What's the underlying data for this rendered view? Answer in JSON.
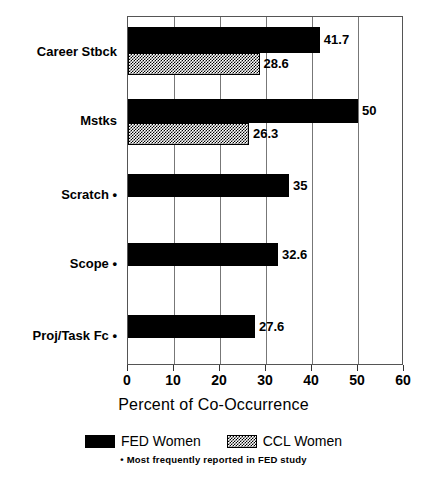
{
  "chart_data": {
    "type": "bar",
    "orientation": "horizontal",
    "title": "",
    "xlabel": "Percent of Co-Occurrence",
    "ylabel": "",
    "xlim": [
      0,
      60
    ],
    "xticks": [
      0,
      10,
      20,
      30,
      40,
      50,
      60
    ],
    "xtick_labels": [
      "0",
      "10",
      "20",
      "30",
      "40",
      "50",
      "60"
    ],
    "grid": true,
    "grid_axis": "x",
    "legend_position": "bottom",
    "categories": [
      "Career Stbck",
      "Mstks",
      "Scratch •",
      "Scope •",
      "Proj/Task Fc •"
    ],
    "series": [
      {
        "name": "FED Women",
        "color": "#000000",
        "fill": "solid",
        "values": [
          41.7,
          50,
          35,
          32.6,
          27.6
        ],
        "value_labels": [
          "41.7",
          "50",
          "35",
          "32.6",
          "27.6"
        ]
      },
      {
        "name": "CCL Women",
        "color": "#808080",
        "fill": "checkered",
        "values": [
          28.6,
          26.3,
          null,
          null,
          null
        ],
        "value_labels": [
          "28.6",
          "26.3",
          "",
          "",
          ""
        ]
      }
    ],
    "footnote": "• Most frequently reported in FED study"
  },
  "bars": [
    {
      "group": "Career Stbck",
      "series": "FED Women",
      "value": 41.7,
      "label": "41.7",
      "top": 26,
      "height": 26
    },
    {
      "group": "Career Stbck",
      "series": "CCL Women",
      "value": 28.6,
      "label": "28.6",
      "top": 52,
      "height": 22
    },
    {
      "group": "Mstks",
      "series": "FED Women",
      "value": 50,
      "label": "50",
      "top": 98,
      "height": 24
    },
    {
      "group": "Mstks",
      "series": "CCL Women",
      "value": 26.3,
      "label": "26.3",
      "top": 122,
      "height": 22
    },
    {
      "group": "Scratch •",
      "series": "FED Women",
      "value": 35,
      "label": "35",
      "top": 173,
      "height": 23
    },
    {
      "group": "Scope •",
      "series": "FED Women",
      "value": 32.6,
      "label": "32.6",
      "top": 242,
      "height": 23
    },
    {
      "group": "Proj/Task Fc •",
      "series": "FED Women",
      "value": 27.6,
      "label": "27.6",
      "top": 314,
      "height": 23
    }
  ],
  "category_positions": [
    {
      "label": "Career Stbck",
      "top": 45
    },
    {
      "label": "Mstks",
      "top": 114
    },
    {
      "label": "Scratch •",
      "top": 188
    },
    {
      "label": "Scope •",
      "top": 257
    },
    {
      "label": "Proj/Task Fc •",
      "top": 329
    }
  ],
  "legend": {
    "entries": [
      {
        "label": "FED Women",
        "swatch": "fed"
      },
      {
        "label": "CCL Women",
        "swatch": "ccl"
      }
    ],
    "footnote": "• Most frequently reported in FED study"
  },
  "axis": {
    "x_title": "Percent of Co-Occurrence"
  }
}
